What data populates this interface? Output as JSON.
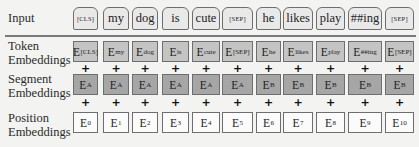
{
  "labels": {
    "input": "Input",
    "token": [
      "Token",
      "Embeddings"
    ],
    "segment": [
      "Segment",
      "Embeddings"
    ],
    "position": [
      "Position",
      "Embeddings"
    ]
  },
  "plus_symbol": "+",
  "columns": [
    {
      "input": "[CLS]",
      "token_sub": "[CLS]",
      "segment_sub": "A",
      "position_sub": "0",
      "small": true
    },
    {
      "input": "my",
      "token_sub": "my",
      "segment_sub": "A",
      "position_sub": "1",
      "small": false
    },
    {
      "input": "dog",
      "token_sub": "dog",
      "segment_sub": "A",
      "position_sub": "2",
      "small": false
    },
    {
      "input": "is",
      "token_sub": "is",
      "segment_sub": "A",
      "position_sub": "3",
      "small": false
    },
    {
      "input": "cute",
      "token_sub": "cute",
      "segment_sub": "A",
      "position_sub": "4",
      "small": false
    },
    {
      "input": "[SEP]",
      "token_sub": "[SEP]",
      "segment_sub": "A",
      "position_sub": "5",
      "small": true
    },
    {
      "input": "he",
      "token_sub": "he",
      "segment_sub": "B",
      "position_sub": "6",
      "small": false
    },
    {
      "input": "likes",
      "token_sub": "likes",
      "segment_sub": "B",
      "position_sub": "7",
      "small": false
    },
    {
      "input": "play",
      "token_sub": "play",
      "segment_sub": "B",
      "position_sub": "8",
      "small": false
    },
    {
      "input": "##ing",
      "token_sub": "##ing",
      "segment_sub": "B",
      "position_sub": "9",
      "small": false
    },
    {
      "input": "[SEP]",
      "token_sub": "[SEP]",
      "segment_sub": "B",
      "position_sub": "10",
      "small": true
    }
  ],
  "embedding_letter": "E",
  "colors": {
    "input_fill": "#e9e9e9",
    "token_fill": "#c4c4c4",
    "segment_fill": "#a6a6a6",
    "position_fill": "#fbfbfb",
    "border": "#6e6e6e"
  }
}
